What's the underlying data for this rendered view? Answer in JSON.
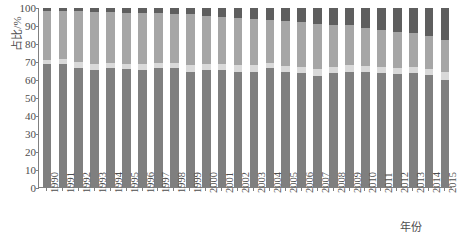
{
  "chart_data": {
    "type": "bar",
    "title": "",
    "subtitle": "",
    "xlabel": "年份",
    "ylabel": "占比/%",
    "stacked": true,
    "normalized": true,
    "grid": false,
    "legend": "none",
    "ylim": [
      0,
      100
    ],
    "yticks": [
      0,
      10,
      20,
      30,
      40,
      50,
      60,
      70,
      80,
      90,
      100
    ],
    "ytick_labels": [
      "0",
      "10",
      "20",
      "30",
      "40",
      "50",
      "60",
      "70",
      "80",
      "90",
      "100"
    ],
    "categories": [
      "1990",
      "1991",
      "1992",
      "1993",
      "1994",
      "1995",
      "1996",
      "1997",
      "1998",
      "1999",
      "2000",
      "2001",
      "2002",
      "2003",
      "2004",
      "2005",
      "2006",
      "2007",
      "2008",
      "2009",
      "2010",
      "2011",
      "2012",
      "2013",
      "2014",
      "2015"
    ],
    "series": [
      {
        "name": "series-1",
        "color": "#7f7f7f",
        "values": [
          68.5,
          69.0,
          66.5,
          65.5,
          66.5,
          66.0,
          65.5,
          66.5,
          66.5,
          64.0,
          65.5,
          65.5,
          64.5,
          64.5,
          66.5,
          64.0,
          63.5,
          62.0,
          63.5,
          64.5,
          64.0,
          63.5,
          63.0,
          63.5,
          62.5,
          60.0
        ]
      },
      {
        "name": "series-2",
        "color": "#d9d9d9",
        "values": [
          2.5,
          2.5,
          3.5,
          3.5,
          3.0,
          3.0,
          3.5,
          3.0,
          3.0,
          4.0,
          3.5,
          3.5,
          3.5,
          3.5,
          3.0,
          3.5,
          3.5,
          4.0,
          3.5,
          3.5,
          3.5,
          3.5,
          3.5,
          3.5,
          3.5,
          4.0
        ]
      },
      {
        "name": "series-3",
        "color": "#a6a6a6",
        "values": [
          27.5,
          27.0,
          28.5,
          29.0,
          28.5,
          28.5,
          28.0,
          27.5,
          27.0,
          28.5,
          26.5,
          26.0,
          26.5,
          26.0,
          24.0,
          25.5,
          25.0,
          25.0,
          23.5,
          22.5,
          21.5,
          20.5,
          20.0,
          19.0,
          18.5,
          18.0
        ]
      },
      {
        "name": "series-4",
        "color": "#5e5e5e",
        "values": [
          1.5,
          1.5,
          1.5,
          2.0,
          2.0,
          2.5,
          3.0,
          3.0,
          3.5,
          3.5,
          4.5,
          5.0,
          5.5,
          6.0,
          6.5,
          7.0,
          8.0,
          9.0,
          9.5,
          9.5,
          11.0,
          12.5,
          13.5,
          14.0,
          15.5,
          18.0
        ]
      }
    ]
  }
}
